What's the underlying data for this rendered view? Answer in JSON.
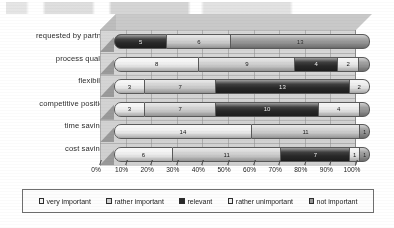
{
  "chart_data": {
    "type": "bar",
    "subtype": "stacked-horizontal-100pct-3d",
    "title": "",
    "xlabel": "",
    "ylabel": "",
    "xlim": [
      0,
      100
    ],
    "xunit": "%",
    "grid": true,
    "legend_position": "bottom",
    "categories": [
      "requested by partner",
      "process quality",
      "flexibility",
      "competitive position",
      "time savings",
      "cost savings"
    ],
    "xticks": [
      "0%",
      "10%",
      "20%",
      "30%",
      "40%",
      "50%",
      "60%",
      "70%",
      "80%",
      "90%",
      "100%"
    ],
    "series": [
      {
        "name": "very important",
        "color": "#f2f2f2",
        "values": [
          0,
          8,
          3,
          3,
          14,
          6
        ]
      },
      {
        "name": "rather important",
        "color": "#d2d2d2",
        "values": [
          6,
          9,
          7,
          7,
          11,
          11
        ]
      },
      {
        "name": "relevant",
        "color": "#2a2a2a",
        "values": [
          5,
          4,
          13,
          10,
          0,
          7
        ]
      },
      {
        "name": "rather unimportant",
        "color": "#ededed",
        "values": [
          0,
          2,
          2,
          4,
          0,
          1
        ]
      },
      {
        "name": "not important",
        "color": "#9a9a9a",
        "values": [
          13,
          1,
          0,
          1,
          1,
          1
        ]
      }
    ],
    "rows": [
      {
        "category": "requested by partner",
        "segments": [
          {
            "series": "relevant",
            "value": 5,
            "label": "5",
            "pct": 20.83
          },
          {
            "series": "rather important",
            "value": 6,
            "label": "6",
            "pct": 25.0
          },
          {
            "series": "not important",
            "value": 13,
            "label": "13",
            "pct": 54.17
          }
        ]
      },
      {
        "category": "process quality",
        "segments": [
          {
            "series": "very important",
            "value": 8,
            "label": "8",
            "pct": 33.33
          },
          {
            "series": "rather important",
            "value": 9,
            "label": "9",
            "pct": 37.5
          },
          {
            "series": "relevant",
            "value": 4,
            "label": "4",
            "pct": 16.67
          },
          {
            "series": "rather unimportant",
            "value": 2,
            "label": "2",
            "pct": 8.33
          },
          {
            "series": "not important",
            "value": 1,
            "label": "",
            "pct": 4.17
          }
        ]
      },
      {
        "category": "flexibility",
        "segments": [
          {
            "series": "very important",
            "value": 3,
            "label": "3",
            "pct": 12.0
          },
          {
            "series": "rather important",
            "value": 7,
            "label": "7",
            "pct": 28.0
          },
          {
            "series": "relevant",
            "value": 13,
            "label": "13",
            "pct": 52.0
          },
          {
            "series": "rather unimportant",
            "value": 2,
            "label": "2",
            "pct": 8.0
          }
        ]
      },
      {
        "category": "competitive position",
        "segments": [
          {
            "series": "very important",
            "value": 3,
            "label": "3",
            "pct": 12.0
          },
          {
            "series": "rather important",
            "value": 7,
            "label": "7",
            "pct": 28.0
          },
          {
            "series": "relevant",
            "value": 10,
            "label": "10",
            "pct": 40.0
          },
          {
            "series": "rather unimportant",
            "value": 4,
            "label": "4",
            "pct": 16.0
          },
          {
            "series": "not important",
            "value": 1,
            "label": "",
            "pct": 4.0
          }
        ]
      },
      {
        "category": "time savings",
        "segments": [
          {
            "series": "very important",
            "value": 14,
            "label": "14",
            "pct": 53.85
          },
          {
            "series": "rather important",
            "value": 11,
            "label": "11",
            "pct": 42.31
          },
          {
            "series": "not important",
            "value": 1,
            "label": "1",
            "pct": 3.84
          }
        ]
      },
      {
        "category": "cost savings",
        "segments": [
          {
            "series": "very important",
            "value": 6,
            "label": "6",
            "pct": 23.08
          },
          {
            "series": "rather important",
            "value": 11,
            "label": "11",
            "pct": 42.31
          },
          {
            "series": "relevant",
            "value": 7,
            "label": "7",
            "pct": 26.92
          },
          {
            "series": "rather unimportant",
            "value": 1,
            "label": "1",
            "pct": 3.85
          },
          {
            "series": "not important",
            "value": 1,
            "label": "1",
            "pct": 3.84
          }
        ]
      }
    ],
    "legend": [
      {
        "label": "very important",
        "color": "#f2f2f2"
      },
      {
        "label": "rather important",
        "color": "#d2d2d2"
      },
      {
        "label": "relevant",
        "color": "#2a2a2a"
      },
      {
        "label": "rather unimportant",
        "color": "#ededed"
      },
      {
        "label": "not important",
        "color": "#9a9a9a"
      }
    ]
  }
}
